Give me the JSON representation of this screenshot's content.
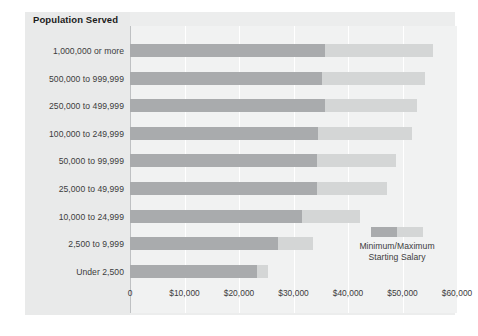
{
  "chart_data": {
    "type": "bar",
    "title": "",
    "subtitle": "",
    "xlabel": "",
    "ylabel": "Population Served",
    "orientation": "horizontal",
    "stacked_range": true,
    "grid": true,
    "legend_position": "inside-bottom-right",
    "xlim": [
      0,
      60000
    ],
    "xticks": [
      0,
      10000,
      20000,
      30000,
      40000,
      50000,
      60000
    ],
    "xtick_labels": [
      "0",
      "$10,000",
      "$20,000",
      "$30,000",
      "$40,000",
      "$50,000",
      "$60,000"
    ],
    "categories": [
      "1,000,000 or more",
      "500,000 to 999,999",
      "250,000 to 499,999",
      "100,000 to 249,999",
      "50,000 to 99,999",
      "25,000 to 49,999",
      "10,000 to 24,999",
      "2,500 to 9,999",
      "Under 2,500"
    ],
    "series": [
      {
        "name": "Minimum Starting Salary",
        "color": "#a9abad",
        "values": [
          35800,
          35200,
          35800,
          34500,
          34300,
          34300,
          31600,
          27200,
          23300
        ]
      },
      {
        "name": "Maximum Starting Salary",
        "color": "#d4d6d6",
        "values": [
          55600,
          54100,
          52700,
          51800,
          48800,
          47200,
          42200,
          33600,
          25300
        ]
      }
    ],
    "legend_label": "Minimum/Maximum Starting Salary",
    "colors": {
      "minimum": "#a9abad",
      "maximum": "#d4d6d6",
      "panel_background": "#eceded",
      "plot_background": "#f1f2f2",
      "label_band_background": "#e9eaea",
      "gridline": "#ffffff",
      "axis": "#bfc1c3",
      "text": "#3c3c3c",
      "title_text": "#1b1b1b"
    }
  },
  "axis": {
    "category_header": "Population Served"
  },
  "legend": {
    "line1": "Minimum/Maximum",
    "line2": "Starting Salary"
  }
}
